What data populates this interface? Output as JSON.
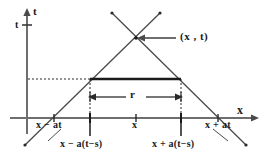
{
  "figure": {
    "background_color": "#ffffff",
    "axis_color": "#6e6e6e",
    "line_color": "#4a4a4a",
    "text_color": "#1a1a1a",
    "thick_segment_color": "#1a1a1a"
  },
  "axes": {
    "vertical_label": "t",
    "horizontal_label": "x",
    "vertical_tick_label": "t"
  },
  "annotations": {
    "point_label": "(x , t)",
    "interval_label": "r"
  },
  "tick_labels": {
    "left_base": "x − at",
    "center": "x",
    "right_base": "x + at",
    "left_inner": "x − a(t−s)",
    "right_inner": "x + a(t−s)"
  },
  "geometry": {
    "origin_x": 27,
    "axis_y": 118,
    "apex_x": 136,
    "apex_y": 38,
    "left_base_x": 54,
    "right_base_x": 218,
    "left_inner_x": 90,
    "right_inner_x": 181,
    "slice_y": 79,
    "measure_y": 97,
    "t_tick_y": 25
  }
}
